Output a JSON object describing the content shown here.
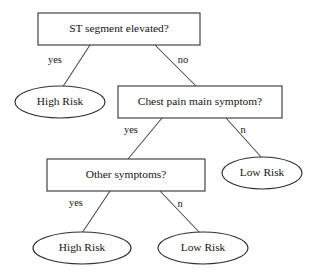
{
  "diagram": {
    "type": "decision-tree",
    "title": "",
    "canvas": {
      "width": 312,
      "height": 277
    },
    "colors": {
      "background": "#ffffff",
      "box_stroke": "#3c3c3c",
      "ellipse_stroke": "#2e2e2e",
      "edge_stroke": "#4a4a4a",
      "text": "#141414"
    },
    "nodes": [
      {
        "id": "root",
        "shape": "rectangle",
        "role": "decision",
        "label": "ST segment elevated?",
        "x": 38,
        "y": 13,
        "w": 162,
        "h": 32
      },
      {
        "id": "high_risk_1",
        "shape": "ellipse",
        "role": "leaf",
        "label": "High Risk",
        "cx": 60,
        "cy": 102,
        "rx": 45,
        "ry": 16
      },
      {
        "id": "chest_pain",
        "shape": "rectangle",
        "role": "decision",
        "label": "Chest pain main symptom?",
        "x": 118,
        "y": 86,
        "w": 164,
        "h": 32
      },
      {
        "id": "other_symptoms",
        "shape": "rectangle",
        "role": "decision",
        "label": "Other symptoms?",
        "x": 47,
        "y": 159,
        "w": 158,
        "h": 32
      },
      {
        "id": "low_risk_1",
        "shape": "ellipse",
        "role": "leaf",
        "label": "Low Risk",
        "cx": 262,
        "cy": 173,
        "rx": 40,
        "ry": 16
      },
      {
        "id": "high_risk_2",
        "shape": "ellipse",
        "role": "leaf",
        "label": "High Risk",
        "cx": 82,
        "cy": 248,
        "rx": 49,
        "ry": 16
      },
      {
        "id": "low_risk_2",
        "shape": "ellipse",
        "role": "leaf",
        "label": "Low Risk",
        "cx": 203,
        "cy": 248,
        "rx": 45,
        "ry": 16
      }
    ],
    "edges": [
      {
        "id": "root-yes",
        "from": "root",
        "to": "high_risk_1",
        "label": "yes",
        "x1": 90,
        "y1": 45,
        "x2": 62,
        "y2": 88,
        "label_x": 55,
        "label_y": 61
      },
      {
        "id": "root-no",
        "from": "root",
        "to": "chest_pain",
        "label": "no",
        "x1": 155,
        "y1": 45,
        "x2": 196,
        "y2": 86,
        "label_x": 183,
        "label_y": 61
      },
      {
        "id": "chest-yes",
        "from": "chest_pain",
        "to": "other_symptoms",
        "label": "yes",
        "x1": 162,
        "y1": 118,
        "x2": 128,
        "y2": 159,
        "label_x": 131,
        "label_y": 131
      },
      {
        "id": "chest-n",
        "from": "chest_pain",
        "to": "low_risk_1",
        "label": "n",
        "x1": 226,
        "y1": 118,
        "x2": 262,
        "y2": 158,
        "label_x": 243,
        "label_y": 131
      },
      {
        "id": "other-yes",
        "from": "other_symptoms",
        "to": "high_risk_2",
        "label": "yes",
        "x1": 110,
        "y1": 191,
        "x2": 82,
        "y2": 233,
        "label_x": 76,
        "label_y": 204
      },
      {
        "id": "other-n",
        "from": "other_symptoms",
        "to": "low_risk_2",
        "label": "n",
        "x1": 160,
        "y1": 191,
        "x2": 200,
        "y2": 233,
        "label_x": 180,
        "label_y": 205
      }
    ]
  }
}
